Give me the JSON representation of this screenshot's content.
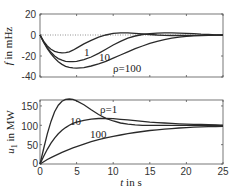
{
  "chart_data": [
    {
      "type": "line",
      "title": "",
      "xlabel": "",
      "ylabel": "f in mHz",
      "xlim": [
        0,
        25
      ],
      "ylim": [
        -40,
        20
      ],
      "yticks": [
        20,
        0,
        -20,
        -40
      ],
      "ytick_labels": [
        "20",
        "0",
        "-20",
        "-40"
      ],
      "xticks": [
        0,
        5,
        10,
        15,
        20,
        25
      ],
      "grid": false,
      "reference_line": {
        "y": 0,
        "style": "dotted"
      },
      "x": [
        0,
        0.5,
        1,
        1.5,
        2,
        2.5,
        3,
        3.5,
        4,
        4.5,
        5,
        6,
        7,
        8,
        9,
        10,
        11,
        12,
        13,
        14,
        15,
        16,
        17,
        18,
        19,
        20,
        21,
        22,
        23,
        24,
        25
      ],
      "series": [
        {
          "name": "ρ=1",
          "values": [
            0,
            -6,
            -10.5,
            -13.5,
            -15.5,
            -16.5,
            -17,
            -16.8,
            -16,
            -14.5,
            -12.5,
            -8.5,
            -5,
            -2,
            0,
            1.5,
            2,
            2,
            1.5,
            1,
            0.5,
            0,
            -0.3,
            -0.5,
            -0.5,
            -0.5,
            -0.4,
            -0.3,
            -0.2,
            -0.1,
            0
          ]
        },
        {
          "name": "10",
          "values": [
            0,
            -6.5,
            -12,
            -16.5,
            -20,
            -22.5,
            -24,
            -25,
            -25.3,
            -25.3,
            -25,
            -23.5,
            -21,
            -17.5,
            -13.5,
            -9.5,
            -6,
            -3,
            -1,
            0.5,
            1.3,
            1.8,
            2,
            2,
            1.8,
            1.5,
            1.2,
            0.8,
            0.5,
            0.2,
            0
          ]
        },
        {
          "name": "ρ=100",
          "values": [
            0,
            -7,
            -13,
            -18,
            -22,
            -25.5,
            -28,
            -29.8,
            -30.8,
            -31.3,
            -31.5,
            -31,
            -29.5,
            -27.5,
            -25,
            -22,
            -19,
            -16,
            -13,
            -10.5,
            -8,
            -6,
            -4.5,
            -3,
            -2,
            -1.3,
            -0.8,
            -0.5,
            -0.3,
            -0.2,
            -0.1
          ]
        }
      ],
      "annotations": [
        {
          "text": "1",
          "x": 8.2,
          "y": -18
        },
        {
          "text": "10",
          "x": 12,
          "y": -22
        },
        {
          "text": "ρ=100",
          "x": 14.2,
          "y": -33
        }
      ]
    },
    {
      "type": "line",
      "title": "",
      "xlabel": "t in s",
      "ylabel": "u1 in MW",
      "xlim": [
        0,
        25
      ],
      "ylim": [
        0,
        165
      ],
      "yticks": [
        0,
        50,
        100,
        150
      ],
      "ytick_labels": [
        "0",
        "50",
        "100",
        "150"
      ],
      "xticks": [
        0,
        5,
        10,
        15,
        20,
        25
      ],
      "xtick_labels": [
        "0",
        "5",
        "10",
        "15",
        "20",
        "25"
      ],
      "grid": false,
      "x": [
        0,
        0.5,
        1,
        1.5,
        2,
        2.5,
        3,
        3.5,
        4,
        4.5,
        5,
        6,
        7,
        8,
        9,
        10,
        11,
        12,
        13,
        14,
        15,
        16,
        17,
        18,
        19,
        20,
        21,
        22,
        23,
        24,
        25
      ],
      "series": [
        {
          "name": "ρ=1",
          "values": [
            0,
            40,
            78,
            110,
            135,
            152,
            162,
            167,
            168,
            167,
            163,
            153,
            140,
            128,
            118,
            111,
            106,
            103,
            101,
            100,
            100,
            100,
            100,
            100,
            100,
            100,
            100,
            100,
            100,
            100,
            100
          ]
        },
        {
          "name": "10",
          "values": [
            0,
            20,
            38,
            54,
            67,
            78,
            87,
            94,
            100,
            105,
            108,
            113,
            116,
            117.5,
            117.5,
            117,
            115.5,
            114,
            112,
            110,
            108,
            107,
            106,
            105,
            104,
            103,
            102.5,
            102,
            101.5,
            101,
            100
          ]
        },
        {
          "name": "100",
          "values": [
            0,
            6,
            11.5,
            16.5,
            21,
            25.5,
            30,
            34,
            38,
            41.5,
            45,
            51.5,
            57.5,
            63,
            67.5,
            71.5,
            75,
            78.5,
            81.5,
            84,
            86.5,
            88.5,
            90,
            91.5,
            93,
            94,
            95,
            96,
            96.5,
            97,
            97.5
          ]
        }
      ],
      "annotations": [
        {
          "text": "ρ=1",
          "x": 9.6,
          "y": 140
        },
        {
          "text": "10",
          "x": 4.8,
          "y": 122
        },
        {
          "text": "100",
          "x": 8.5,
          "y": 74
        }
      ]
    }
  ],
  "top_plot": {
    "ylabel_main": "f",
    "ylabel_rest": " in mHz",
    "yticks": [
      "20",
      "0",
      "-20",
      "-40"
    ],
    "labels": {
      "l1": "1",
      "l10": "10",
      "l100": "ρ=100"
    }
  },
  "bottom_plot": {
    "ylabel_main": "u",
    "ylabel_sub": "1",
    "ylabel_rest": " in MW",
    "yticks": [
      "150",
      "100",
      "50",
      "0"
    ],
    "xticks": [
      "0",
      "5",
      "10",
      "15",
      "20",
      "25"
    ],
    "xlabel_var": "t",
    "xlabel_rest": " in s",
    "labels": {
      "l1": "ρ=1",
      "l10": "10",
      "l100": "100"
    }
  }
}
